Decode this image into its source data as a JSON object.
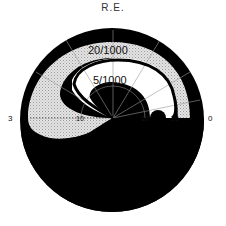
{
  "title": "R.E.",
  "diagram": {
    "type": "visual-field-chart",
    "eye": "right",
    "isopters": [
      {
        "label": "20/1000",
        "shading": "stippled"
      },
      {
        "label": "5/1000",
        "shading": "clear"
      }
    ],
    "scale_labels": {
      "left_outer": "3",
      "left_inner": "10",
      "right_inner": "10",
      "right_mid": "20",
      "right_outer": "0"
    },
    "colors": {
      "scotoma": "#000000",
      "stipple": "#c8c8c8",
      "background": "#ffffff",
      "grid": "#888888"
    }
  }
}
